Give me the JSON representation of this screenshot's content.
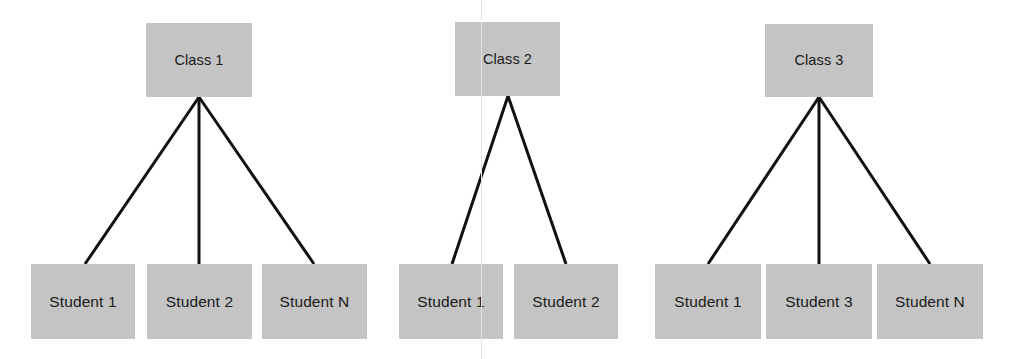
{
  "diagram": {
    "type": "tree",
    "background_color": "#ffffff",
    "node_fill_color": "#c4c4c4",
    "edge_color": "#111111",
    "text_color": "#1a1a1a",
    "groups": [
      {
        "id": "group-1",
        "parent": {
          "label": "Class 1",
          "x": 146,
          "y": 23,
          "width": 106,
          "height": 74
        },
        "apex": {
          "x": 199,
          "y": 97
        },
        "children": [
          {
            "label": "Student 1",
            "x": 31,
            "y": 264,
            "width": 104,
            "height": 75,
            "connect_x": 85,
            "connect_y": 264
          },
          {
            "label": "Student 2",
            "x": 147,
            "y": 264,
            "width": 105,
            "height": 75,
            "connect_x": 199,
            "connect_y": 264
          },
          {
            "label": "Student N",
            "x": 262,
            "y": 264,
            "width": 105,
            "height": 75,
            "connect_x": 314,
            "connect_y": 264
          }
        ]
      },
      {
        "id": "group-2",
        "parent": {
          "label": "Class 2",
          "x": 455,
          "y": 22,
          "width": 105,
          "height": 74
        },
        "apex": {
          "x": 508,
          "y": 96
        },
        "children": [
          {
            "label": "Student 1",
            "x": 399,
            "y": 264,
            "width": 104,
            "height": 75,
            "connect_x": 452,
            "connect_y": 264
          },
          {
            "label": "Student 2",
            "x": 514,
            "y": 264,
            "width": 104,
            "height": 75,
            "connect_x": 566,
            "connect_y": 264
          }
        ]
      },
      {
        "id": "group-3",
        "parent": {
          "label": "Class 3",
          "x": 765,
          "y": 24,
          "width": 108,
          "height": 73
        },
        "apex": {
          "x": 819,
          "y": 97
        },
        "children": [
          {
            "label": "Student 1",
            "x": 655,
            "y": 264,
            "width": 106,
            "height": 75,
            "connect_x": 708,
            "connect_y": 264
          },
          {
            "label": "Student 3",
            "x": 766,
            "y": 264,
            "width": 106,
            "height": 75,
            "connect_x": 819,
            "connect_y": 264
          },
          {
            "label": "Student N",
            "x": 877,
            "y": 264,
            "width": 106,
            "height": 75,
            "connect_x": 930,
            "connect_y": 264
          }
        ]
      }
    ],
    "scan_seam": {
      "x": 481,
      "color": "#e2e2e2"
    }
  }
}
